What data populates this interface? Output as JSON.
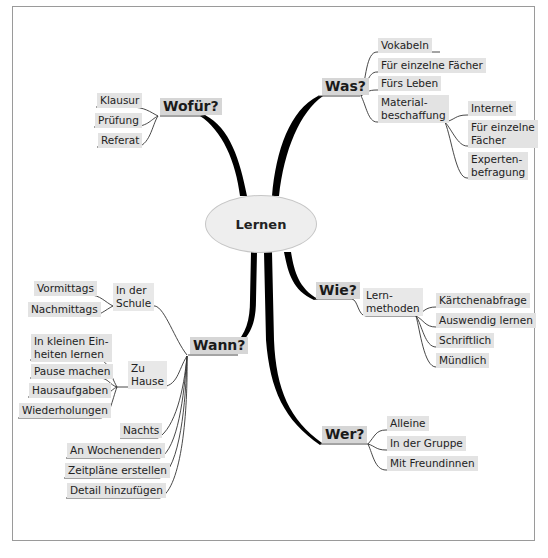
{
  "mindmap": {
    "central": "Lernen",
    "branches": {
      "wofuer": {
        "label": "Wofür?",
        "children": [
          "Klausur",
          "Prüfung",
          "Referat"
        ]
      },
      "was": {
        "label": "Was?",
        "children": [
          "Vokabeln",
          "Für einzelne Fächer",
          "Fürs Leben",
          "Material-\nbeschaffung"
        ],
        "material_children": [
          "Internet",
          "Für einzelne\nFächer",
          "Experten-\nbefragung"
        ]
      },
      "wie": {
        "label": "Wie?",
        "sub": "Lern-\nmethoden",
        "children": [
          "Kärtchenabfrage",
          "Auswendig lernen",
          "Schriftlich",
          "Mündlich"
        ]
      },
      "wer": {
        "label": "Wer?",
        "children": [
          "Alleine",
          "In der Gruppe",
          "Mit Freundinnen"
        ]
      },
      "wann": {
        "label": "Wann?",
        "schule": {
          "label": "In der\nSchule",
          "children": [
            "Vormittags",
            "Nachmittags"
          ]
        },
        "zuhause": {
          "label": "Zu\nHause",
          "children": [
            "In kleinen Ein-\nheiten lernen",
            "Pause machen",
            "Hausaufgaben",
            "Wiederholungen"
          ]
        },
        "children": [
          "Nachts",
          "An Wochenenden",
          "Zeitpläne erstellen",
          "Detail hinzufügen"
        ]
      }
    }
  },
  "colors": {
    "node_bg": "#e3e3e3",
    "main_node_bg": "#d6d6d6",
    "branch": "#000000",
    "frame": "#9a9a9a"
  }
}
